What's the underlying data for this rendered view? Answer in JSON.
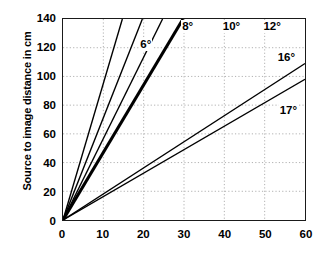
{
  "chart_data": {
    "type": "line",
    "title": "",
    "subtitle": "",
    "xlabel": "",
    "ylabel": "Source to image distance in cm",
    "xlim": [
      0,
      60
    ],
    "ylim": [
      0,
      140
    ],
    "xticks": [
      0,
      10,
      20,
      30,
      40,
      50,
      60
    ],
    "yticks": [
      0,
      20,
      40,
      60,
      80,
      100,
      120,
      140
    ],
    "grid": true,
    "grid_style": "dotted",
    "grid_color": "#b0b0b0",
    "legend": "inline-labels",
    "legend_position": "on-lines",
    "axis_color": "#1a1a1a",
    "line_color": "#000000",
    "background": "#ffffff",
    "note": "Straight lines through the origin; each line labeled with an angle. Line for 12 degrees is drawn bold/thick.",
    "series": [
      {
        "name": "6°",
        "label": "6°",
        "slope": 9.514,
        "x": [
          0,
          14.715
        ],
        "values": [
          0,
          140
        ],
        "emphasis": false,
        "linewidth": 1.4,
        "label_x": 21.7,
        "label_y": 121.5
      },
      {
        "name": "8°",
        "label": "8°",
        "slope": 7.115,
        "x": [
          0,
          19.676
        ],
        "values": [
          0,
          140
        ],
        "emphasis": false,
        "linewidth": 1.4,
        "label_x": 32.0,
        "label_y": 133.5
      },
      {
        "name": "10°",
        "label": "10°",
        "slope": 5.671,
        "x": [
          0,
          24.687
        ],
        "values": [
          0,
          140
        ],
        "emphasis": false,
        "linewidth": 1.4,
        "label_x": 42.0,
        "label_y": 133.5
      },
      {
        "name": "12°",
        "label": "12°",
        "slope": 4.705,
        "x": [
          0,
          29.757
        ],
        "values": [
          0,
          140
        ],
        "emphasis": true,
        "linewidth": 3.1,
        "label_x": 52.0,
        "label_y": 133.5
      },
      {
        "name": "16°",
        "label": "16°",
        "slope": 3.487,
        "x": [
          0,
          60
        ],
        "values": [
          0,
          109
        ],
        "emphasis": false,
        "linewidth": 1.4,
        "label_x": 55.5,
        "label_y": 112.5
      },
      {
        "name": "17°",
        "label": "17°",
        "slope": 3.271,
        "x": [
          0,
          60
        ],
        "values": [
          0,
          98
        ],
        "emphasis": false,
        "linewidth": 1.4,
        "label_x": 56.0,
        "label_y": 76.0
      }
    ]
  },
  "axes": {
    "y_title": "Source to image distance in cm",
    "y_tick_labels": [
      "140",
      "120",
      "100",
      "80",
      "60",
      "40",
      "20",
      "0"
    ],
    "x_tick_labels": [
      "0",
      "10",
      "20",
      "30",
      "40",
      "50",
      "60"
    ]
  }
}
